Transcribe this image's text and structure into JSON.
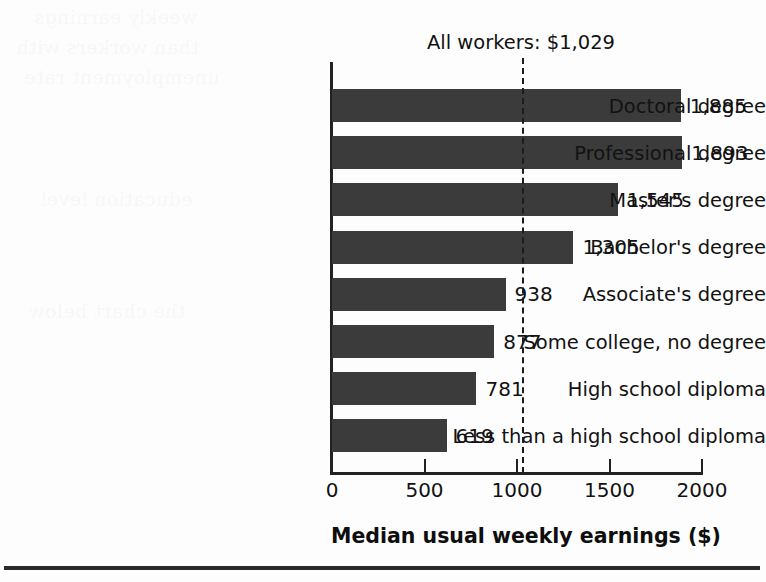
{
  "chart_data": {
    "type": "bar",
    "orientation": "horizontal",
    "title": "",
    "xlabel": "Median usual weekly earnings ($)",
    "ylabel": "",
    "xlim": [
      0,
      2000
    ],
    "xticks": [
      "0",
      "500",
      "1000",
      "1500",
      "2000"
    ],
    "xtick_values": [
      0,
      500,
      1000,
      1500,
      2000
    ],
    "grid": false,
    "legend": "none",
    "categories": [
      "Doctoral degree",
      "Professional degree",
      "Master's degree",
      "Bachelor's degree",
      "Associate's degree",
      "Some college, no degree",
      "High school diploma",
      "Less than a high school diploma"
    ],
    "values": [
      1885,
      1893,
      1545,
      1305,
      938,
      877,
      781,
      619
    ],
    "value_labels": [
      "1,885",
      "1,893",
      "1,545",
      "1,305",
      "938",
      "877",
      "781",
      "619"
    ],
    "annotations": [
      {
        "name": "all-workers-reference",
        "text": "All workers: $1,029",
        "value": 1029,
        "style": "dashed-vertical-line"
      }
    ],
    "bar_color": "#3b3b3b",
    "background_color": "#fdfdfd",
    "text_color": "#121212"
  },
  "axis": {
    "x_title": "Median usual weekly earnings ($)",
    "ticks": [
      "0",
      "500",
      "1000",
      "1500",
      "2000"
    ]
  },
  "reference": {
    "label": "All workers: $1,029",
    "value": 1029
  },
  "ghost_text": {
    "lines": [
      "weekly earnings",
      "than workers with",
      "unemployment rate",
      "education level",
      "the chart below"
    ]
  }
}
